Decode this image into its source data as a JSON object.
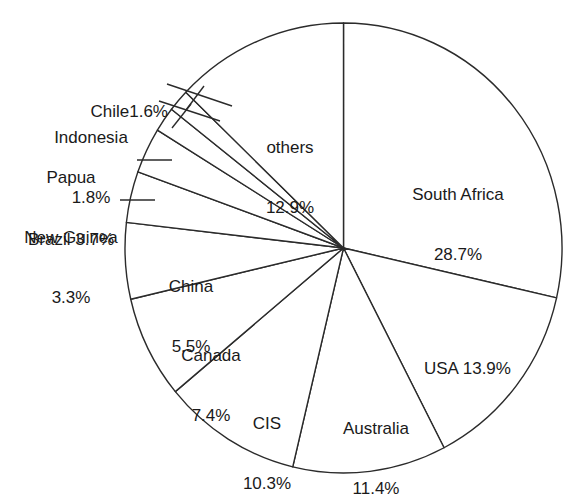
{
  "chart_data": {
    "type": "pie",
    "title": "",
    "subtitle": "",
    "xlabel": "",
    "ylabel": "",
    "unit": "%",
    "legend_position": "none",
    "grid": false,
    "start_angle_deg": 0,
    "direction": "clockwise",
    "stroke_color": "#2b2b2b",
    "fill_color": "#ffffff",
    "categories": [
      "South Africa",
      "USA",
      "Australia",
      "CIS",
      "Canada",
      "China",
      "Brazil",
      "Papua New Guinea",
      "Indonesia",
      "Chile",
      "others"
    ],
    "values": [
      28.7,
      13.9,
      11.4,
      10.3,
      7.4,
      5.5,
      3.7,
      3.3,
      1.8,
      1.6,
      12.9
    ],
    "slices": [
      {
        "name": "South Africa",
        "value": 28.7,
        "label_line1": "South Africa",
        "label_line2": "28.7%",
        "callout": false
      },
      {
        "name": "USA",
        "value": 13.9,
        "label_line1": "USA 13.9%",
        "label_line2": "",
        "callout": false
      },
      {
        "name": "Australia",
        "value": 11.4,
        "label_line1": "Australia",
        "label_line2": "11.4%",
        "callout": false
      },
      {
        "name": "CIS",
        "value": 10.3,
        "label_line1": "CIS",
        "label_line2": "10.3%",
        "callout": false
      },
      {
        "name": "Canada",
        "value": 7.4,
        "label_line1": "Canada",
        "label_line2": "7.4%",
        "callout": false
      },
      {
        "name": "China",
        "value": 5.5,
        "label_line1": "China",
        "label_line2": "5.5%",
        "callout": false
      },
      {
        "name": "Brazil",
        "value": 3.7,
        "label_line1": "Brazil 3.7%",
        "label_line2": "",
        "callout": true
      },
      {
        "name": "Papua New Guinea",
        "value": 3.3,
        "label_line1": "Papua",
        "label_line2": "New Guinea",
        "label_line3": "3.3%",
        "callout": true
      },
      {
        "name": "Indonesia",
        "value": 1.8,
        "label_line1": "Indonesia",
        "label_line2": "1.8%",
        "callout": true
      },
      {
        "name": "Chile",
        "value": 1.6,
        "label_line1": "Chile1.6%",
        "label_line2": "",
        "callout": true
      },
      {
        "name": "others",
        "value": 12.9,
        "label_line1": "others",
        "label_line2": "12.9%",
        "callout": false
      }
    ]
  },
  "labels": {
    "south_africa": {
      "l1": "South Africa",
      "l2": "28.7%"
    },
    "usa": {
      "l1": "USA 13.9%"
    },
    "australia": {
      "l1": "Australia",
      "l2": "11.4%"
    },
    "cis": {
      "l1": "CIS",
      "l2": "10.3%"
    },
    "canada": {
      "l1": "Canada",
      "l2": "7.4%"
    },
    "china": {
      "l1": "China",
      "l2": "5.5%"
    },
    "brazil": {
      "l1": "Brazil 3.7%"
    },
    "papua": {
      "l1": "Papua",
      "l2": "New Guinea",
      "l3": "3.3%"
    },
    "indonesia": {
      "l1": "Indonesia",
      "l2": "1.8%"
    },
    "chile": {
      "l1": "Chile1.6%"
    },
    "others": {
      "l1": "others",
      "l2": "12.9%"
    }
  }
}
